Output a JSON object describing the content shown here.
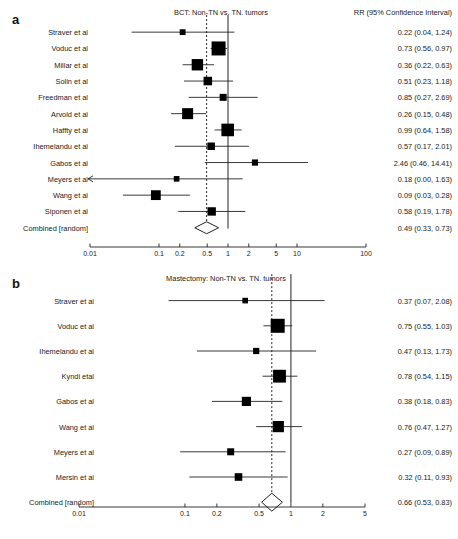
{
  "figure": {
    "panel_a_letter": "a",
    "panel_b_letter": "b",
    "column_header": "RR (95% Confidence Interval)",
    "combined_label": "Combined [random]"
  },
  "chart_data": [
    {
      "type": "forest",
      "panel": "a",
      "title": "BCT: Non-TN vs. TN. tumors",
      "xlabel": "",
      "ylabel": "",
      "effect_measure": "RR",
      "xscale": "log",
      "xlim": [
        0.01,
        100
      ],
      "xticks": [
        0.01,
        0.1,
        0.2,
        0.5,
        1,
        2,
        5,
        10,
        100
      ],
      "xticklabels": [
        "0.01",
        "0.1",
        "0.2",
        "0.5",
        "1",
        "2",
        "5",
        "10",
        "100"
      ],
      "reference_line": 1,
      "pooled_line": 0.49,
      "grid": false,
      "legend": "none",
      "column_header": "RR (95% Confidence Interval)",
      "studies": [
        {
          "label": "Straver et al",
          "rr": 0.22,
          "lo": 0.04,
          "hi": 1.24,
          "text": "0.22 (0.04, 1.24)",
          "weight": 0.18,
          "arrow_left": false
        },
        {
          "label": "Voduc et al",
          "rr": 0.73,
          "lo": 0.56,
          "hi": 0.97,
          "text": "0.73 (0.56, 0.97)",
          "weight": 1.0,
          "arrow_left": false
        },
        {
          "label": "Millar et al",
          "rr": 0.36,
          "lo": 0.22,
          "hi": 0.63,
          "text": "0.36 (0.22, 0.63)",
          "weight": 0.74,
          "arrow_left": false
        },
        {
          "label": "Solin et al",
          "rr": 0.51,
          "lo": 0.23,
          "hi": 1.18,
          "text": "0.51 (0.23, 1.18)",
          "weight": 0.45,
          "arrow_left": false
        },
        {
          "label": "Freedman et al",
          "rr": 0.85,
          "lo": 0.27,
          "hi": 2.69,
          "text": "0.85 (0.27, 2.69)",
          "weight": 0.3,
          "arrow_left": false
        },
        {
          "label": "Arvold et al",
          "rr": 0.26,
          "lo": 0.15,
          "hi": 0.48,
          "text": "0.26 (0.15, 0.48)",
          "weight": 0.7,
          "arrow_left": false
        },
        {
          "label": "Haffty et al",
          "rr": 0.99,
          "lo": 0.64,
          "hi": 1.58,
          "text": "0.99 (0.64, 1.58)",
          "weight": 0.86,
          "arrow_left": false
        },
        {
          "label": "Ihemelandu et al",
          "rr": 0.57,
          "lo": 0.17,
          "hi": 2.01,
          "text": "0.57 (0.17, 2.01)",
          "weight": 0.35,
          "arrow_left": false
        },
        {
          "label": "Gabos et al",
          "rr": 2.46,
          "lo": 0.46,
          "hi": 14.41,
          "text": "2.46 (0.46, 14.41)",
          "weight": 0.22,
          "arrow_left": false
        },
        {
          "label": "Meyers et al",
          "rr": 0.18,
          "lo": 0.0,
          "hi": 1.63,
          "text": "0.18 (0.00, 1.63)",
          "weight": 0.16,
          "arrow_left": true
        },
        {
          "label": "Wang et al",
          "rr": 0.09,
          "lo": 0.03,
          "hi": 0.28,
          "text": "0.09 (0.03, 0.28)",
          "weight": 0.58,
          "arrow_left": false
        },
        {
          "label": "Siponen et al",
          "rr": 0.58,
          "lo": 0.19,
          "hi": 1.78,
          "text": "0.58 (0.19, 1.78)",
          "weight": 0.44,
          "arrow_left": false
        }
      ],
      "combined": {
        "label": "Combined [random]",
        "rr": 0.49,
        "lo": 0.33,
        "hi": 0.73,
        "text": "0.49 (0.33, 0.73)"
      }
    },
    {
      "type": "forest",
      "panel": "b",
      "title": "Mastectomy: Non-TN vs. TN. tumors",
      "xlabel": "",
      "ylabel": "",
      "effect_measure": "RR",
      "xscale": "log",
      "xlim": [
        0.01,
        5
      ],
      "xticks": [
        0.01,
        0.1,
        0.2,
        0.5,
        1,
        2,
        5
      ],
      "xticklabels": [
        "0.01",
        "0.1",
        "0.2",
        "0.5",
        "1",
        "2",
        "5"
      ],
      "reference_line": 1,
      "pooled_line": 0.66,
      "grid": false,
      "legend": "none",
      "column_header": "",
      "studies": [
        {
          "label": "Straver et al",
          "rr": 0.37,
          "lo": 0.07,
          "hi": 2.08,
          "text": "0.37 (0.07, 2.08)",
          "weight": 0.16,
          "arrow_left": false
        },
        {
          "label": "Voduc et al",
          "rr": 0.75,
          "lo": 0.55,
          "hi": 1.03,
          "text": "0.75 (0.55, 1.03)",
          "weight": 1.0,
          "arrow_left": false
        },
        {
          "label": "Ihemelandu et al",
          "rr": 0.47,
          "lo": 0.13,
          "hi": 1.73,
          "text": "0.47 (0.13, 1.73)",
          "weight": 0.22,
          "arrow_left": false
        },
        {
          "label": "Kyndi etal",
          "rr": 0.78,
          "lo": 0.54,
          "hi": 1.15,
          "text": "0.78 (0.54, 1.15)",
          "weight": 0.88,
          "arrow_left": false
        },
        {
          "label": "Gabos et al",
          "rr": 0.38,
          "lo": 0.18,
          "hi": 0.83,
          "text": "0.38 (0.18, 0.83)",
          "weight": 0.52,
          "arrow_left": false
        },
        {
          "label": "Wang et al",
          "rr": 0.76,
          "lo": 0.47,
          "hi": 1.27,
          "text": "0.76 (0.47, 1.27)",
          "weight": 0.72,
          "arrow_left": false
        },
        {
          "label": "Meyers et al",
          "rr": 0.27,
          "lo": 0.09,
          "hi": 0.89,
          "text": "0.27 (0.09, 0.89)",
          "weight": 0.3,
          "arrow_left": false
        },
        {
          "label": "Mersin et al",
          "rr": 0.32,
          "lo": 0.11,
          "hi": 0.93,
          "text": "0.32 (0.11, 0.93)",
          "weight": 0.36,
          "arrow_left": false
        }
      ],
      "combined": {
        "label": "Combined [random]",
        "rr": 0.66,
        "lo": 0.53,
        "hi": 0.83,
        "text": "0.66 (0.53, 0.83)"
      }
    }
  ]
}
